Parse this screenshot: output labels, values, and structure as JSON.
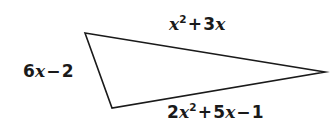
{
  "figure": {
    "kind": "geometry-diagram",
    "shape": "triangle",
    "background_color": "#ffffff",
    "stroke_color": "#1a1a1a",
    "text_color": "#1a1a1a",
    "stroke_width": 1.6,
    "width": 331,
    "height": 136
  },
  "triangle": {
    "vertices": [
      {
        "name": "top-left-vertex",
        "x": 85,
        "y": 33
      },
      {
        "name": "right-vertex",
        "x": 325,
        "y": 72
      },
      {
        "name": "bottom-left-vertex",
        "x": 112,
        "y": 108
      }
    ],
    "points_attr": "85,33 325,72 112,108"
  },
  "labels": {
    "top": {
      "name": "side-label-top",
      "text": "x² + 3x",
      "coefficient_1": "",
      "var_1": "x",
      "exponent_1": "2",
      "operator_1": "+",
      "coefficient_2": "3",
      "var_2": "x",
      "side": "upper side"
    },
    "left": {
      "name": "side-label-left",
      "text": "6x − 2",
      "coefficient_1": "6",
      "var_1": "x",
      "operator_1": "−",
      "constant": "2",
      "side": "left side"
    },
    "bottom": {
      "name": "side-label-bottom",
      "text": "2x² + 5x − 1",
      "coefficient_1": "2",
      "var_1": "x",
      "exponent_1": "2",
      "operator_1": "+",
      "coefficient_2": "5",
      "var_2": "x",
      "operator_2": "−",
      "constant": "1",
      "side": "lower side"
    }
  }
}
